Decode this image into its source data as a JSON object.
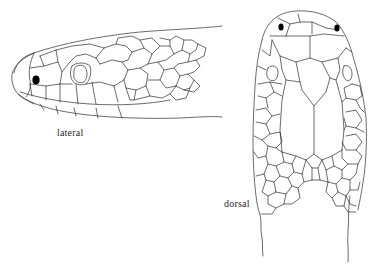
{
  "figure": {
    "views": [
      {
        "id": "lateral",
        "label": "lateral"
      },
      {
        "id": "dorsal",
        "label": "dorsal"
      }
    ]
  },
  "colors": {
    "line": "#2b2b2b",
    "eye": "#000000",
    "background": "#ffffff"
  }
}
